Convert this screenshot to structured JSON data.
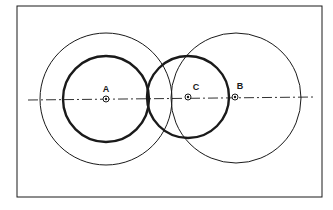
{
  "diagram": {
    "type": "geometric-construction",
    "colors": {
      "stroke": "#1a1a1a",
      "background": "#ffffff"
    },
    "points": [
      {
        "id": "A",
        "label": "A"
      },
      {
        "id": "C",
        "label": "C"
      },
      {
        "id": "B",
        "label": "B"
      }
    ],
    "circles": [
      {
        "center": "A",
        "style": "thick"
      },
      {
        "center": "A",
        "style": "thin"
      },
      {
        "center": "C",
        "style": "thick"
      },
      {
        "center": "B",
        "style": "thin"
      }
    ],
    "centerline": {
      "style": "dash-dot"
    }
  }
}
